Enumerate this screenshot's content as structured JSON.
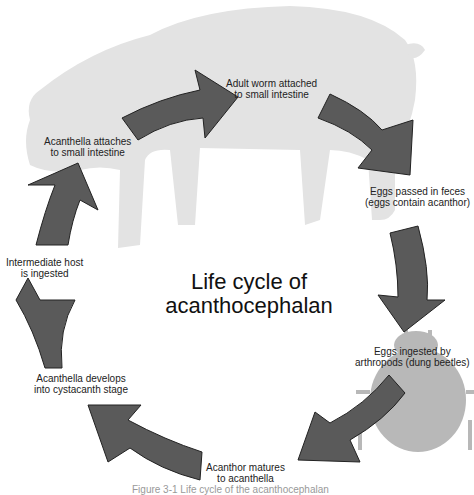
{
  "title": {
    "line1": "Life cycle of",
    "line2": "acanthocephalan"
  },
  "colors": {
    "arrow_fill": "#5a5a5a",
    "arrow_stroke": "#222222",
    "silhouette": "#e3e3e3",
    "beetle": "#b8b8b8"
  },
  "icons": {
    "host_silhouette": "pig-icon",
    "intermediate_host": "dung-beetle-icon"
  },
  "stages": [
    {
      "line1": "Adult worm attached",
      "line2": "to small intestine"
    },
    {
      "line1": "Eggs passed in feces",
      "line2": "(eggs contain acanthor)"
    },
    {
      "line1": "Eggs ingested by",
      "line2": "arthropods (dung beetles)"
    },
    {
      "line1": "Acanthor matures",
      "line2": "to acanthella"
    },
    {
      "line1": "Acanthella develops",
      "line2": "into cystacanth stage"
    },
    {
      "line1": "Intermediate host",
      "line2": "is ingested"
    },
    {
      "line1": "Acanthella attaches",
      "line2": "to small intestine"
    }
  ],
  "caption": "Figure 3-1  Life cycle of the acanthocephalan"
}
